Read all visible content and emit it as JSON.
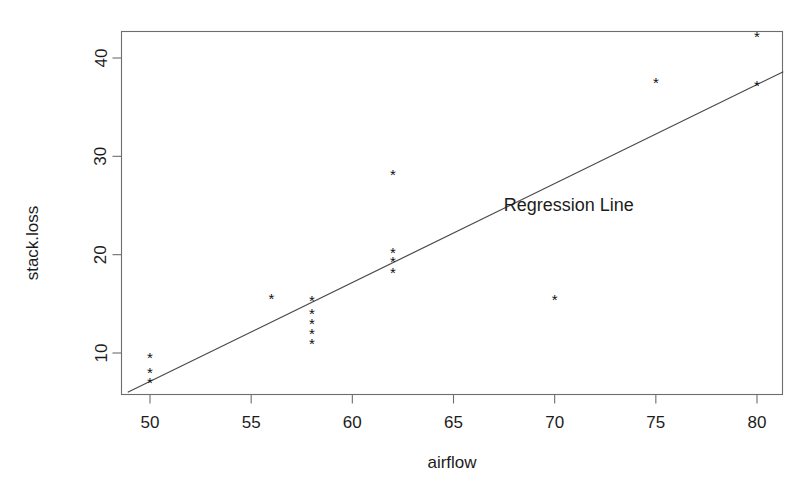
{
  "chart_data": {
    "type": "scatter",
    "title": "",
    "xlabel": "airflow",
    "ylabel": "stack.loss",
    "xlim": [
      48.2,
      81.3
    ],
    "ylim": [
      5.6,
      43.5
    ],
    "grid": false,
    "legend": null,
    "point_marker": "*",
    "x": [
      50,
      50,
      50,
      56,
      58,
      58,
      58,
      58,
      58,
      62,
      62,
      62,
      62,
      70,
      75,
      80,
      80
    ],
    "y": [
      9.5,
      8.0,
      7.0,
      15.5,
      15.3,
      14.0,
      13.0,
      12.0,
      11.0,
      28.2,
      20.2,
      19.3,
      18.2,
      15.4,
      37.5,
      42.2,
      37.2
    ],
    "points": [
      {
        "x": 50,
        "y": 9.5
      },
      {
        "x": 50,
        "y": 8.0
      },
      {
        "x": 50,
        "y": 7.0
      },
      {
        "x": 56,
        "y": 15.5
      },
      {
        "x": 58,
        "y": 15.3
      },
      {
        "x": 58,
        "y": 14.0
      },
      {
        "x": 58,
        "y": 13.0
      },
      {
        "x": 58,
        "y": 12.0
      },
      {
        "x": 58,
        "y": 11.0
      },
      {
        "x": 62,
        "y": 28.2
      },
      {
        "x": 62,
        "y": 20.2
      },
      {
        "x": 62,
        "y": 19.3
      },
      {
        "x": 62,
        "y": 18.2
      },
      {
        "x": 70,
        "y": 15.4
      },
      {
        "x": 75,
        "y": 37.5
      },
      {
        "x": 80,
        "y": 42.2
      },
      {
        "x": 80,
        "y": 37.2
      }
    ],
    "xticks": [
      50,
      55,
      60,
      65,
      70,
      75,
      80
    ],
    "xtick_labels": [
      "50",
      "55",
      "60",
      "65",
      "70",
      "75",
      "80"
    ],
    "yticks": [
      10,
      20,
      30,
      40
    ],
    "ytick_labels": [
      "10",
      "20",
      "30",
      "40"
    ],
    "regression_line": {
      "label": "Regression Line",
      "x_start": 48.9,
      "y_start": 6.0,
      "x_end": 81.3,
      "y_end": 38.6,
      "label_x": 70.7,
      "label_y": 24.4
    },
    "colors": {
      "point": "#111111",
      "line": "#4a4a4a",
      "axis": "#6d6d6d",
      "text": "#1c1c1c",
      "background": "#ffffff"
    }
  }
}
